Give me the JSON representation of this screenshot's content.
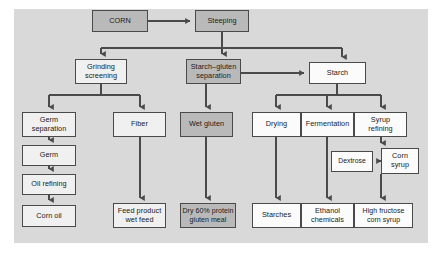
{
  "diagram": {
    "panel_color": "#d9d9d9",
    "shade_colors": {
      "light": "#f0f0f0",
      "white": "#fbfbfb",
      "dark": "#b9b9b9",
      "border": "#4a4a4a",
      "connector": "#4a4a4a"
    },
    "nodes": [
      {
        "id": "corn",
        "label": "CORN",
        "shade": "dark",
        "x": 92,
        "y": 10,
        "w": 56,
        "h": 22
      },
      {
        "id": "steeping",
        "label": "Steeping",
        "shade": "dark",
        "x": 195,
        "y": 10,
        "w": 54,
        "h": 22
      },
      {
        "id": "grinding",
        "label": "Grinding\nscreening",
        "shade": "light",
        "x": 75,
        "y": 59,
        "w": 52,
        "h": 25
      },
      {
        "id": "starch_gluten",
        "label": "Starch–gluten\nseparation",
        "shade": "dark",
        "x": 186,
        "y": 59,
        "w": 55,
        "h": 25
      },
      {
        "id": "starch",
        "label": "Starch",
        "shade": "white",
        "x": 309,
        "y": 62,
        "w": 57,
        "h": 22
      },
      {
        "id": "germ_separation",
        "label": "Germ\nseparation",
        "shade": "light",
        "x": 22,
        "y": 112,
        "w": 54,
        "h": 25
      },
      {
        "id": "fiber",
        "label": "Fiber",
        "shade": "light",
        "x": 113,
        "y": 112,
        "w": 53,
        "h": 25
      },
      {
        "id": "wet_gluten",
        "label": "Wet gluten",
        "shade": "dark",
        "x": 180,
        "y": 112,
        "w": 53,
        "h": 25
      },
      {
        "id": "drying",
        "label": "Drying",
        "shade": "white",
        "x": 252,
        "y": 112,
        "w": 49,
        "h": 25
      },
      {
        "id": "fermentation",
        "label": "Fermentation",
        "shade": "white",
        "x": 301,
        "y": 112,
        "w": 53,
        "h": 25
      },
      {
        "id": "syrup_refining",
        "label": "Syrup\nrefining",
        "shade": "white",
        "x": 354,
        "y": 112,
        "w": 53,
        "h": 25
      },
      {
        "id": "germ",
        "label": "Germ",
        "shade": "light",
        "x": 22,
        "y": 145,
        "w": 54,
        "h": 21
      },
      {
        "id": "dextrose",
        "label": "Dextrose",
        "shade": "white",
        "x": 331,
        "y": 151,
        "w": 42,
        "h": 21
      },
      {
        "id": "corn_syrup",
        "label": "Corn\nsyrup",
        "shade": "white",
        "x": 381,
        "y": 148,
        "w": 38,
        "h": 26
      },
      {
        "id": "oil_refining",
        "label": "Oil refining",
        "shade": "light",
        "x": 22,
        "y": 174,
        "w": 54,
        "h": 21
      },
      {
        "id": "corn_oil",
        "label": "Corn oil",
        "shade": "light",
        "x": 22,
        "y": 205,
        "w": 54,
        "h": 22
      },
      {
        "id": "feed_product",
        "label": "Feed product\nwet feed",
        "shade": "light",
        "x": 113,
        "y": 203,
        "w": 53,
        "h": 25
      },
      {
        "id": "gluten_meal",
        "label": "Dry 60% protein\ngluten meal",
        "shade": "dark",
        "x": 180,
        "y": 203,
        "w": 56,
        "h": 25
      },
      {
        "id": "starches",
        "label": "Starches",
        "shade": "white",
        "x": 252,
        "y": 203,
        "w": 49,
        "h": 25
      },
      {
        "id": "ethanol",
        "label": "Ethanol\nchemicals",
        "shade": "white",
        "x": 301,
        "y": 203,
        "w": 53,
        "h": 25
      },
      {
        "id": "hfcs",
        "label": "High fructose\ncorn syrup",
        "shade": "white",
        "x": 354,
        "y": 203,
        "w": 59,
        "h": 25
      }
    ],
    "edges": [
      {
        "from": "corn",
        "to": "steeping"
      },
      {
        "from": "steeping",
        "to": "grinding"
      },
      {
        "from": "steeping",
        "to": "starch_gluten"
      },
      {
        "from": "steeping",
        "to": "starch"
      },
      {
        "from": "starch_gluten",
        "to": "starch"
      },
      {
        "from": "grinding",
        "to": "germ_separation"
      },
      {
        "from": "grinding",
        "to": "fiber"
      },
      {
        "from": "starch_gluten",
        "to": "wet_gluten"
      },
      {
        "from": "starch",
        "to": "drying"
      },
      {
        "from": "starch",
        "to": "fermentation"
      },
      {
        "from": "starch",
        "to": "syrup_refining"
      },
      {
        "from": "germ_separation",
        "to": "germ"
      },
      {
        "from": "germ",
        "to": "oil_refining"
      },
      {
        "from": "oil_refining",
        "to": "corn_oil"
      },
      {
        "from": "fiber",
        "to": "feed_product"
      },
      {
        "from": "wet_gluten",
        "to": "gluten_meal"
      },
      {
        "from": "drying",
        "to": "starches"
      },
      {
        "from": "fermentation",
        "to": "ethanol"
      },
      {
        "from": "syrup_refining",
        "to": "corn_syrup"
      },
      {
        "from": "corn_syrup",
        "to": "dextrose"
      },
      {
        "from": "corn_syrup",
        "to": "hfcs"
      }
    ]
  }
}
